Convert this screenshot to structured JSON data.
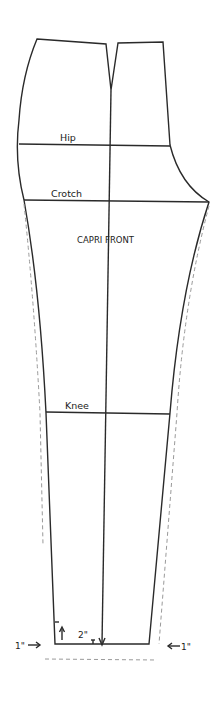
{
  "diagram": {
    "title": "CAPRI FRONT",
    "labels": {
      "hip": "Hip",
      "crotch": "Crotch",
      "knee": "Knee",
      "hem_raise": "2\"",
      "left_extension": "1\"",
      "right_extension": "1\""
    },
    "colors": {
      "line": "#2a2a2a",
      "dashed": "#9a9a9a",
      "background": "#ffffff"
    }
  }
}
